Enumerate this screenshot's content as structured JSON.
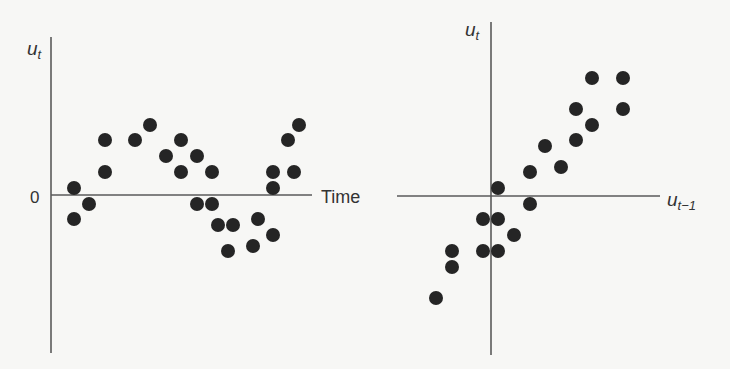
{
  "chart_data": [
    {
      "type": "scatter",
      "panel": "left",
      "title": "",
      "ylabel": "u_t",
      "xlabel": "Time",
      "y_tick_labels": [
        "0"
      ],
      "grid": false,
      "description": "Residuals u_t plotted against time show positive autocorrelation (runs of same-sign values)",
      "points_px": [
        [
          74,
          188
        ],
        [
          74,
          219
        ],
        [
          89,
          204
        ],
        [
          105,
          140
        ],
        [
          105,
          172
        ],
        [
          135,
          140
        ],
        [
          150,
          125
        ],
        [
          166,
          156
        ],
        [
          181,
          140
        ],
        [
          181,
          172
        ],
        [
          197,
          156
        ],
        [
          197,
          204
        ],
        [
          212,
          172
        ],
        [
          212,
          204
        ],
        [
          218,
          225
        ],
        [
          233,
          225
        ],
        [
          228,
          251
        ],
        [
          258,
          219
        ],
        [
          253,
          246
        ],
        [
          273,
          172
        ],
        [
          273,
          188
        ],
        [
          273,
          235
        ],
        [
          288,
          140
        ],
        [
          294,
          172
        ],
        [
          299,
          125
        ]
      ],
      "axes_px": {
        "origin": [
          51,
          195
        ],
        "y_top": 37,
        "y_bottom": 353,
        "x_right": 312
      }
    },
    {
      "type": "scatter",
      "panel": "right",
      "title": "",
      "ylabel": "u_t",
      "xlabel": "u_{t-1}",
      "grid": false,
      "description": "u_t plotted against u_{t-1} shows a positive linear relationship",
      "points_px": [
        [
          592,
          78
        ],
        [
          623,
          78
        ],
        [
          576,
          109
        ],
        [
          623,
          109
        ],
        [
          592,
          125
        ],
        [
          576,
          140
        ],
        [
          545,
          146
        ],
        [
          561,
          167
        ],
        [
          530,
          172
        ],
        [
          498,
          188
        ],
        [
          530,
          204
        ],
        [
          483,
          219
        ],
        [
          498,
          219
        ],
        [
          514,
          235
        ],
        [
          452,
          251
        ],
        [
          483,
          251
        ],
        [
          498,
          251
        ],
        [
          452,
          267
        ],
        [
          436,
          298
        ]
      ],
      "axes_px": {
        "origin": [
          491,
          196
        ],
        "y_top": 22,
        "y_bottom": 355,
        "x_left": 397,
        "x_right": 660
      }
    }
  ],
  "labels": {
    "left_y": "u",
    "left_y_sub": "t",
    "left_zero": "0",
    "left_x": "Time",
    "right_y": "u",
    "right_y_sub": "t",
    "right_x": "u",
    "right_x_sub": "t−1"
  },
  "colors": {
    "dot": "#252525",
    "axis": "#5a5a5a",
    "background": "#f7f7f5",
    "text": "#333333"
  }
}
